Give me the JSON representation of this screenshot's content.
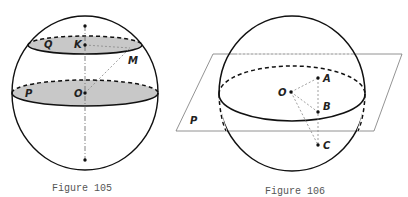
{
  "figures": [
    {
      "caption": "Figure 105",
      "labels": {
        "Q": "Q",
        "K": "K",
        "M": "M",
        "P": "P",
        "O": "O"
      },
      "colors": {
        "section_fill": "#c8c8c8",
        "stroke": "#111111",
        "dash": "#888888"
      }
    },
    {
      "caption": "Figure 106",
      "labels": {
        "O": "O",
        "A": "A",
        "B": "B",
        "C": "C",
        "P": "P"
      },
      "colors": {
        "stroke": "#111111",
        "plane": "#777777",
        "dash": "#888888"
      }
    }
  ]
}
